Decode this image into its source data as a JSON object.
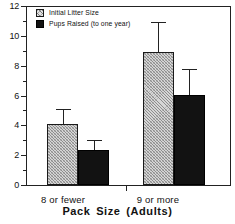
{
  "chart_data": {
    "type": "bar",
    "title": "",
    "xlabel": "Pack  Size  (Adults)",
    "ylabel": "",
    "categories": [
      "8  or  fewer",
      "9  or  more"
    ],
    "ylim": [
      0,
      12
    ],
    "yticks": [
      0,
      2,
      4,
      6,
      8,
      10,
      12
    ],
    "ytick_labels": [
      "0",
      "2",
      "4",
      "6",
      "8",
      "10",
      "12"
    ],
    "yminor_step": 1,
    "grid": false,
    "legend_position": "top-left",
    "series": [
      {
        "name": "Initial Litter Size",
        "fill": "hatched",
        "color": "#d6d6d6",
        "values": [
          4.1,
          8.9
        ],
        "errors_upper": [
          1.0,
          2.0
        ],
        "error_tops": [
          5.1,
          10.9
        ]
      },
      {
        "name": "Pups Raised (to one year)",
        "fill": "solid",
        "color": "#121212",
        "values": [
          2.35,
          6.05
        ],
        "errors_upper": [
          0.65,
          1.75
        ],
        "error_tops": [
          3.0,
          7.8
        ]
      }
    ]
  },
  "legend": {
    "items": [
      {
        "label": "Initial Litter Size",
        "swatch": "hatched"
      },
      {
        "label": "Pups Raised (to one year)",
        "swatch": "solid"
      }
    ]
  },
  "axes": {
    "x_title": "Pack  Size  (Adults)",
    "x_categories": [
      "8  or  fewer",
      "9  or  more"
    ],
    "y_labels": [
      "12",
      "10",
      "8",
      "6",
      "4",
      "2",
      "0"
    ]
  }
}
